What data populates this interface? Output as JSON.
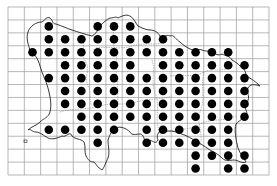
{
  "map": {
    "type": "distribution-dot-map",
    "region_shape": "island outline with internal parish boundaries",
    "grid": {
      "left": 8,
      "top": 7,
      "right": 269,
      "bottom": 175,
      "columns": 16,
      "rows": 13,
      "line_color": "#9a9a9a"
    },
    "dot_color": "#000000",
    "coast_color": "#222222",
    "boundary_color": "#8a8a8a",
    "occupied_cells": [
      {
        "row": 1,
        "cols": [
          2,
          5,
          6,
          7
        ]
      },
      {
        "row": 2,
        "cols": [
          2,
          3,
          4,
          5,
          6,
          7,
          8,
          9
        ]
      },
      {
        "row": 3,
        "cols": [
          1,
          2,
          3,
          4,
          5,
          6,
          7,
          8,
          9,
          10,
          11,
          12,
          13
        ]
      },
      {
        "row": 4,
        "cols": [
          3,
          4,
          5,
          6,
          7,
          9,
          10,
          11,
          12,
          13,
          14
        ]
      },
      {
        "row": 5,
        "cols": [
          2,
          3,
          4,
          5,
          6,
          7,
          8,
          9,
          10,
          11,
          12,
          13,
          14
        ]
      },
      {
        "row": 6,
        "cols": [
          3,
          4,
          5,
          6,
          7,
          8,
          9,
          10,
          11,
          12,
          13,
          14
        ]
      },
      {
        "row": 7,
        "cols": [
          3,
          4,
          5,
          6,
          7,
          8,
          9,
          10,
          11,
          12,
          13,
          14
        ]
      },
      {
        "row": 8,
        "cols": [
          4,
          5,
          6,
          7,
          8,
          9,
          10,
          11,
          12,
          13,
          14
        ]
      },
      {
        "row": 9,
        "cols": [
          2,
          3,
          4,
          5,
          6,
          8,
          9,
          10,
          11,
          12,
          13
        ]
      },
      {
        "row": 10,
        "cols": [
          5,
          8,
          9,
          10,
          11,
          12,
          13
        ]
      },
      {
        "row": 11,
        "cols": [
          11,
          12,
          13,
          14
        ]
      },
      {
        "row": 12,
        "cols": [
          11,
          13,
          14
        ]
      }
    ]
  }
}
